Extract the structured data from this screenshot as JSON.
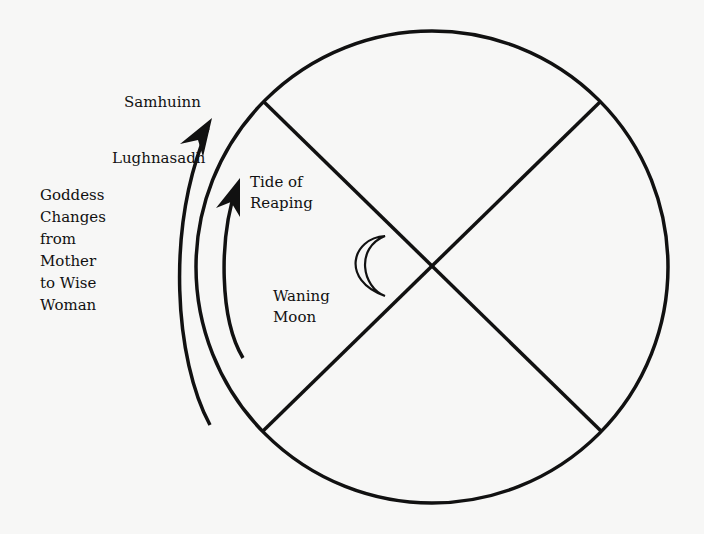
{
  "diagram": {
    "type": "wheel-of-year-quadrant",
    "labels": {
      "top_point": "Samhuinn",
      "bottom_point": "Lughnasadh",
      "tide": [
        "Tide of",
        "Reaping"
      ],
      "moon": [
        "Waning",
        "Moon"
      ],
      "goddess": [
        "Goddess",
        "Changes",
        "from",
        "Mother",
        "to Wise",
        "Woman"
      ]
    },
    "icons": [
      "crescent-moon-icon",
      "arrow-up-icon"
    ],
    "colors": {
      "ink": "#111111",
      "paper": "#f7f7f6"
    }
  }
}
